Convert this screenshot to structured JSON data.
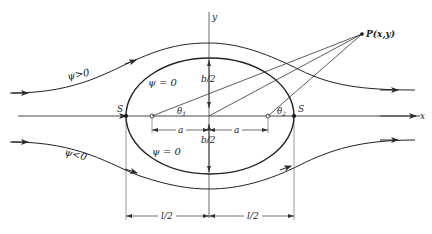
{
  "figure": {
    "axes": {
      "x_label": "x",
      "y_label": "y"
    },
    "point": {
      "label": "P(x,y)"
    },
    "stagnation_points": {
      "left_label": "S",
      "right_label": "S"
    },
    "angles": {
      "theta1": "θ",
      "theta1_sub": "1",
      "theta2": "θ",
      "theta2_sub": "2"
    },
    "streamlines": {
      "upper_label": "ψ>0",
      "lower_label": "ψ<0",
      "body_upper_label": "ψ = 0",
      "body_lower_label": "ψ = 0"
    },
    "dimensions": {
      "half_height_upper": "b/2",
      "half_height_lower": "b/2",
      "a_left": "a",
      "a_right": "a",
      "half_length_left": "l/2",
      "half_length_right": "l/2"
    },
    "colors": {
      "line": "#2a2a2a",
      "thin": "#555555"
    }
  }
}
